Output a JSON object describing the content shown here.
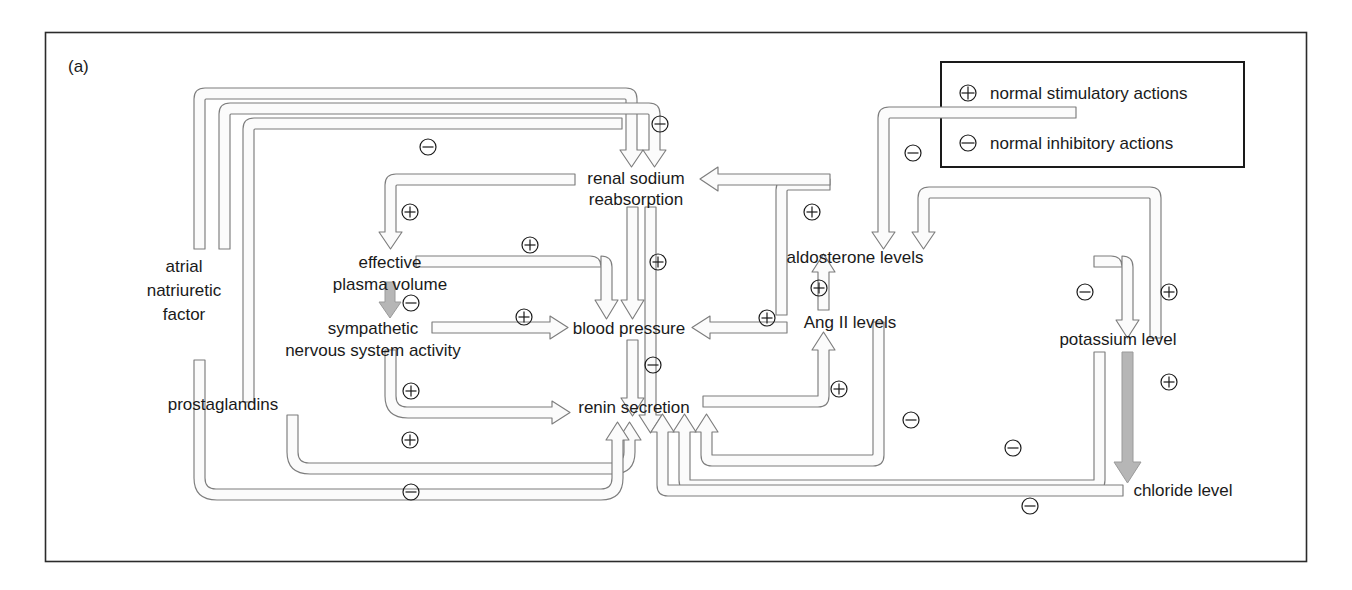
{
  "panel": {
    "label": "(a)"
  },
  "legend": {
    "items": [
      {
        "symbol": "plus",
        "label": "normal stimulatory actions"
      },
      {
        "symbol": "minus",
        "label": "normal inhibitory actions"
      }
    ]
  },
  "nodes": {
    "atrial_natriuretic_factor": {
      "lines": [
        "atrial",
        "natriuretic",
        "factor"
      ]
    },
    "prostaglandins": {
      "label": "prostaglandins"
    },
    "renal_sodium_reabsorption": {
      "lines": [
        "renal sodium",
        "reabsorption"
      ]
    },
    "effective_plasma_volume": {
      "lines": [
        "effective",
        "plasma volume"
      ]
    },
    "sympathetic_nervous_system_activity": {
      "lines": [
        "sympathetic",
        "nervous system activity"
      ]
    },
    "blood_pressure": {
      "label": "blood pressure"
    },
    "renin_secretion": {
      "label": "renin secretion"
    },
    "aldosterone_levels": {
      "label": "aldosterone levels"
    },
    "ang_ii_levels": {
      "label": "Ang II levels"
    },
    "potassium_level": {
      "label": "potassium level"
    },
    "chloride_level": {
      "label": "chloride level"
    }
  },
  "edge_signs": [
    {
      "id": "anf-to-renal-sodium",
      "sign": "minus",
      "x": 428,
      "y": 147
    },
    {
      "id": "anf-to-renal-sodium-2",
      "sign": "minus",
      "x": 660,
      "y": 124
    },
    {
      "id": "aldosterone-to-renal-sodium",
      "sign": "minus",
      "x": 913,
      "y": 153
    },
    {
      "id": "renal-sodium-to-effective-plasma-volume",
      "sign": "plus",
      "x": 410,
      "y": 212
    },
    {
      "id": "ang-ii-to-renal-sodium",
      "sign": "plus",
      "x": 812,
      "y": 212
    },
    {
      "id": "effective-plasma-volume-to-blood-pressure",
      "sign": "plus",
      "x": 530,
      "y": 245
    },
    {
      "id": "renal-sodium-to-blood-pressure",
      "sign": "plus",
      "x": 658,
      "y": 262
    },
    {
      "id": "effective-plasma-volume-to-sympathetic",
      "sign": "minus",
      "x": 411,
      "y": 303
    },
    {
      "id": "sympathetic-to-blood-pressure",
      "sign": "plus",
      "x": 524,
      "y": 317
    },
    {
      "id": "ang-ii-to-aldosterone",
      "sign": "plus",
      "x": 819,
      "y": 288
    },
    {
      "id": "ang-ii-to-blood-pressure",
      "sign": "plus",
      "x": 767,
      "y": 318
    },
    {
      "id": "potassium-to-aldosterone",
      "sign": "minus",
      "x": 1085,
      "y": 292
    },
    {
      "id": "aldosterone-to-potassium",
      "sign": "plus",
      "x": 1169,
      "y": 292
    },
    {
      "id": "blood-pressure-to-renin",
      "sign": "minus",
      "x": 653,
      "y": 365
    },
    {
      "id": "sympathetic-to-renin",
      "sign": "plus",
      "x": 411,
      "y": 391
    },
    {
      "id": "renin-to-ang-ii",
      "sign": "plus",
      "x": 839,
      "y": 389
    },
    {
      "id": "potassium-to-chloride",
      "sign": "plus",
      "x": 1169,
      "y": 382
    },
    {
      "id": "aldosterone-to-renin",
      "sign": "minus",
      "x": 911,
      "y": 420
    },
    {
      "id": "prostaglandins-to-renin",
      "sign": "plus",
      "x": 410,
      "y": 440
    },
    {
      "id": "potassium-to-renin",
      "sign": "minus",
      "x": 1013,
      "y": 448
    },
    {
      "id": "anf-to-renin",
      "sign": "minus",
      "x": 411,
      "y": 492
    },
    {
      "id": "chloride-to-renin",
      "sign": "minus",
      "x": 1030,
      "y": 506
    }
  ],
  "colors": {
    "ink": "#1a1a1a",
    "connector_stroke": "#7d7d7d",
    "connector_fill": "#fbfbfb",
    "solid_arrow": "#b6b6b6",
    "border": "#2b2b2b"
  }
}
